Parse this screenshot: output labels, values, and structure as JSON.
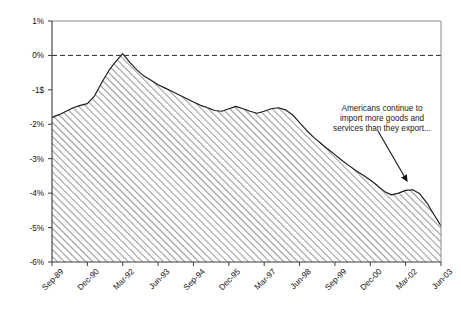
{
  "chart_data": {
    "type": "area",
    "title": "",
    "subtitle": "",
    "xlabel": "",
    "ylabel": "",
    "grid": false,
    "legend": null,
    "ylim": [
      -6,
      1
    ],
    "y_tick_labels": [
      "1%",
      "0%",
      "-1$",
      "-2%",
      "-3%",
      "-4%",
      "-5%",
      "-6%"
    ],
    "y_tick_values": [
      1,
      0,
      -1,
      -2,
      -3,
      -4,
      -5,
      -6
    ],
    "zero_line": 0,
    "x_tick_labels": [
      "Sep-89",
      "Dec-90",
      "Mar-92",
      "Jun-93",
      "Sep-94",
      "Dec-95",
      "Mar-97",
      "Jun-98",
      "Sep-99",
      "Dec-00",
      "Mar-02",
      "Jun-03"
    ],
    "categories": [
      "Sep-89",
      "Dec-89",
      "Mar-90",
      "Jun-90",
      "Sep-90",
      "Dec-90",
      "Mar-91",
      "Jun-91",
      "Sep-91",
      "Dec-91",
      "Mar-92",
      "Jun-92",
      "Sep-92",
      "Dec-92",
      "Mar-93",
      "Jun-93",
      "Sep-93",
      "Dec-93",
      "Mar-94",
      "Jun-94",
      "Sep-94",
      "Dec-94",
      "Mar-95",
      "Jun-95",
      "Sep-95",
      "Dec-95",
      "Mar-96",
      "Jun-96",
      "Sep-96",
      "Dec-96",
      "Mar-97",
      "Jun-97",
      "Sep-97",
      "Dec-97",
      "Mar-98",
      "Jun-98",
      "Sep-98",
      "Dec-98",
      "Mar-99",
      "Jun-99",
      "Sep-99",
      "Dec-99",
      "Mar-00",
      "Jun-00",
      "Sep-00",
      "Dec-00",
      "Mar-01",
      "Jun-01",
      "Sep-01",
      "Dec-01",
      "Mar-02",
      "Jun-02",
      "Sep-02",
      "Dec-02",
      "Mar-03",
      "Jun-03"
    ],
    "values": [
      -1.8,
      -1.72,
      -1.62,
      -1.52,
      -1.45,
      -1.4,
      -1.18,
      -0.8,
      -0.45,
      -0.18,
      0.05,
      -0.2,
      -0.42,
      -0.6,
      -0.72,
      -0.85,
      -0.95,
      -1.05,
      -1.15,
      -1.25,
      -1.35,
      -1.45,
      -1.52,
      -1.6,
      -1.62,
      -1.55,
      -1.48,
      -1.55,
      -1.62,
      -1.68,
      -1.62,
      -1.55,
      -1.52,
      -1.58,
      -1.72,
      -1.95,
      -2.18,
      -2.38,
      -2.55,
      -2.72,
      -2.88,
      -3.05,
      -3.2,
      -3.35,
      -3.48,
      -3.62,
      -3.78,
      -3.95,
      -4.05,
      -4.0,
      -3.92,
      -3.9,
      -4.02,
      -4.28,
      -4.62,
      -4.95
    ],
    "annotation": {
      "lines": [
        "Americans continue to",
        "import more goods and",
        "services than they export..."
      ],
      "arrow": {
        "from_x": 378,
        "from_y": 131,
        "to_x": 407,
        "to_y": 181
      }
    },
    "series_style": {
      "fill": "hatch-45",
      "hatch_color": "#9a9a9a",
      "line_color": "#1a1a1a",
      "background": "#ffffff"
    }
  }
}
